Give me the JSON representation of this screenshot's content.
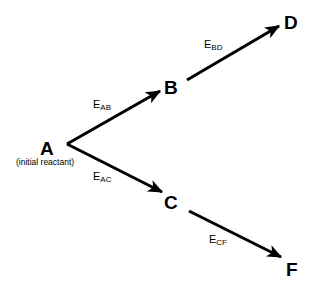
{
  "diagram": {
    "nodes": [
      {
        "id": "A",
        "label": "A",
        "note": "(initial reactant)"
      },
      {
        "id": "B",
        "label": "B"
      },
      {
        "id": "C",
        "label": "C"
      },
      {
        "id": "D",
        "label": "D"
      },
      {
        "id": "F",
        "label": "F"
      }
    ],
    "edges": [
      {
        "from": "A",
        "to": "B",
        "label_main": "E",
        "label_sub": "AB"
      },
      {
        "from": "B",
        "to": "D",
        "label_main": "E",
        "label_sub": "BD"
      },
      {
        "from": "A",
        "to": "C",
        "label_main": "E",
        "label_sub": "AC"
      },
      {
        "from": "C",
        "to": "F",
        "label_main": "E",
        "label_sub": "CF"
      }
    ],
    "colors": {
      "stroke": "#000000",
      "background": "#ffffff"
    }
  }
}
